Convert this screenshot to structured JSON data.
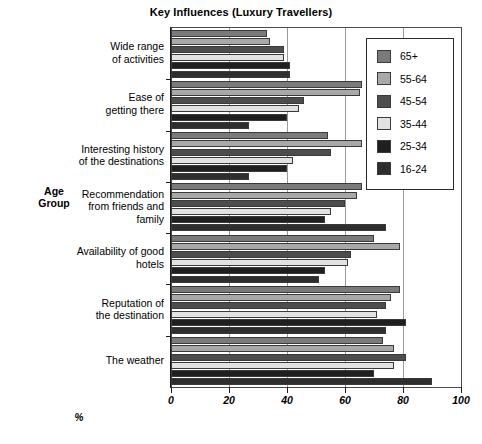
{
  "chart_data": {
    "type": "bar",
    "orientation": "horizontal",
    "title": "Key Influences (Luxury Travellers)",
    "xlabel": "%",
    "ylabel": "Age Group",
    "xlim": [
      0,
      100
    ],
    "xticks": [
      0,
      20,
      40,
      60,
      80,
      100
    ],
    "grid": true,
    "legend_position": "upper right",
    "categories": [
      "Wide range of activities",
      "Ease of getting there",
      "Interesting history of the destinations",
      "Recommendation from friends and family",
      "Availability of good hotels",
      "Reputation of the destination",
      "The weather"
    ],
    "category_lines": [
      [
        "Wide range",
        "of activities"
      ],
      [
        "Ease of",
        "getting there"
      ],
      [
        "Interesting history",
        "of the destinations"
      ],
      [
        "Recommendation",
        "from friends and",
        "family"
      ],
      [
        "Availability of good",
        "hotels"
      ],
      [
        "Reputation of",
        "the destination"
      ],
      [
        "The weather"
      ]
    ],
    "series": [
      {
        "name": "65+",
        "color": "#7a7a7a",
        "values": [
          33,
          66,
          54,
          66,
          70,
          79,
          73
        ]
      },
      {
        "name": "55-64",
        "color": "#a8a8a8",
        "values": [
          34,
          65,
          66,
          64,
          79,
          76,
          77
        ]
      },
      {
        "name": "45-54",
        "color": "#4d4d4d",
        "values": [
          39,
          46,
          55,
          60,
          62,
          74,
          81
        ]
      },
      {
        "name": "35-44",
        "color": "#e2e2e2",
        "values": [
          39,
          44,
          42,
          55,
          61,
          71,
          77
        ]
      },
      {
        "name": "25-34",
        "color": "#1f1f1f",
        "values": [
          41,
          40,
          40,
          53,
          53,
          81,
          70
        ]
      },
      {
        "name": "16-24",
        "color": "#2e2e2e",
        "values": [
          41,
          27,
          27,
          74,
          51,
          74,
          90
        ]
      }
    ]
  },
  "axis": {
    "x_tick_labels": [
      "0",
      "20",
      "40",
      "60",
      "80",
      "100"
    ],
    "x_axis_title": "%",
    "y_axis_title_lines": [
      "Age",
      "Group"
    ]
  }
}
